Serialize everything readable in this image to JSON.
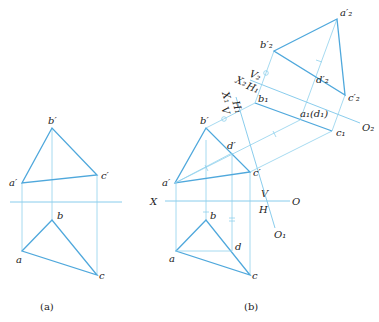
{
  "figure_a": {
    "caption": "(a)",
    "labels": {
      "b_prime": "b′",
      "a_prime": "a′",
      "c_prime": "c′",
      "b": "b",
      "a": "a",
      "c": "c"
    }
  },
  "figure_b": {
    "caption": "(b)",
    "labels": {
      "b_prime": "b′",
      "a_prime": "a′",
      "c_prime": "c′",
      "d_prime": "d′",
      "b": "b",
      "a": "a",
      "c": "c",
      "d": "d",
      "X": "X",
      "V": "V",
      "H": "H",
      "O": "O",
      "X1": "X₁",
      "V1": "V",
      "H1": "H₁",
      "O1": "O₁",
      "X2": "X₂",
      "V2": "V₂",
      "H2": "H₁",
      "O2": "O₂",
      "b1": "b₁",
      "c1": "c₁",
      "a1d1": "a₁(d₁)",
      "a2p": "a′₂",
      "b2p": "b′₂",
      "c2p": "c′₂",
      "d2p": "d′₂"
    }
  },
  "colors": {
    "thick_line": "#4fa8dc",
    "thin_line": "#8fd0ec",
    "text": "#222222"
  }
}
